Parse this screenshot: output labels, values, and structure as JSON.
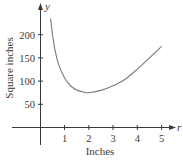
{
  "chart_data": {
    "type": "line",
    "title": "",
    "xlabel": "Inches",
    "ylabel": "Square inches",
    "x_axis_variable": "r",
    "y_axis_variable": "y",
    "xlim": [
      0,
      5.4
    ],
    "ylim": [
      0,
      270
    ],
    "x_ticks": [
      1,
      2,
      3,
      4,
      5
    ],
    "y_ticks": [
      50,
      100,
      150,
      200
    ],
    "x_tick_labels": [
      "1",
      "2",
      "3",
      "4",
      "5"
    ],
    "y_tick_labels": [
      "50",
      "100",
      "150",
      "200"
    ],
    "grid": false,
    "legend": null,
    "series": [
      {
        "name": "surface area",
        "x": [
          0.43,
          0.5,
          0.6,
          0.75,
          1.0,
          1.25,
          1.5,
          1.75,
          2.0,
          2.5,
          3.0,
          3.5,
          4.0,
          4.5,
          5.0
        ],
        "y": [
          235,
          203,
          170,
          137,
          107,
          90,
          81,
          77,
          75,
          80,
          90,
          104,
          126,
          150,
          175
        ]
      }
    ],
    "annotations": [
      {
        "text": "minimum near r = 2, y ≈ 75"
      }
    ]
  },
  "axes": {
    "x_var": "r",
    "y_var": "y",
    "x_title": "Inches",
    "y_title": "Square inches",
    "x_ticks": [
      "1",
      "2",
      "3",
      "4",
      "5"
    ],
    "y_ticks": [
      "50",
      "100",
      "150",
      "200"
    ]
  }
}
